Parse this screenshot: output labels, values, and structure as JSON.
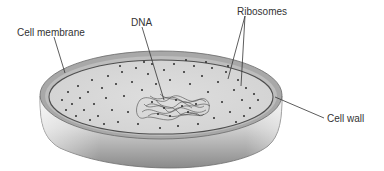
{
  "diagram": {
    "labels": [
      {
        "id": "cell-membrane",
        "text": "Cell membrane",
        "x": 17,
        "y": 30
      },
      {
        "id": "dna",
        "text": "DNA",
        "x": 131,
        "y": 20
      },
      {
        "id": "ribosomes",
        "text": "Ribosomes",
        "x": 237,
        "y": 9
      },
      {
        "id": "cell-wall",
        "text": "Cell wall",
        "x": 327,
        "y": 119
      }
    ],
    "colors": {
      "background": "#ffffff",
      "cell_wall_rim": "#a9a9a9",
      "cell_membrane_line": "#555555",
      "cytoplasm": "#d9d9d9",
      "ribosome_dot": "#2b2b2b",
      "dna_strand": "#4a4a4a",
      "side_wall_light": "#e8e8e8",
      "side_wall_dark": "#8e8e8e",
      "label_text": "#333333",
      "leader_line": "#333333"
    }
  }
}
